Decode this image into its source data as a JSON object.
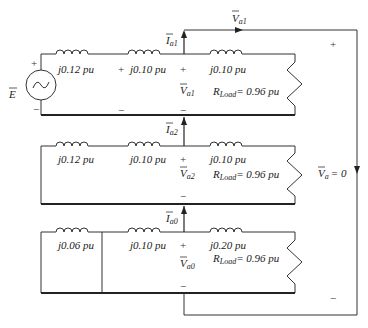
{
  "source": {
    "label": "E",
    "plus": "+",
    "minus": "−"
  },
  "networks": [
    {
      "name": "positive-sequence",
      "inductors": [
        "j0.12 pu",
        "j0.10 pu",
        "j0.10 pu"
      ],
      "current": {
        "symbol": "I",
        "sub": "a1"
      },
      "voltage": {
        "symbol": "V",
        "sub": "a1"
      },
      "load": {
        "symbol": "R",
        "sub": "Load",
        "value": "= 0.96 pu"
      },
      "plus": "+",
      "minus": "−",
      "mid_plus": "+",
      "mid_minus": "−"
    },
    {
      "name": "negative-sequence",
      "inductors": [
        "j0.12 pu",
        "j0.10 pu",
        "j0.10 pu"
      ],
      "current": {
        "symbol": "I",
        "sub": "a2"
      },
      "voltage": {
        "symbol": "V",
        "sub": "a2"
      },
      "load": {
        "symbol": "R",
        "sub": "Load",
        "value": "= 0.96 pu"
      },
      "plus": "+",
      "minus": "−"
    },
    {
      "name": "zero-sequence",
      "inductors": [
        "j0.06 pu",
        "j0.10 pu",
        "j0.20 pu"
      ],
      "current": {
        "symbol": "I",
        "sub": "a0"
      },
      "voltage": {
        "symbol": "V",
        "sub": "a0"
      },
      "load": {
        "symbol": "R",
        "sub": "Load",
        "value": "= 0.96 pu"
      },
      "plus": "+",
      "minus": "−"
    }
  ],
  "outer_loop": {
    "top_label": {
      "symbol": "V",
      "sub": "a1"
    },
    "phase_voltage": {
      "symbol": "V",
      "sub": "a",
      "value": "= 0"
    },
    "plus": "+",
    "minus": "−"
  }
}
